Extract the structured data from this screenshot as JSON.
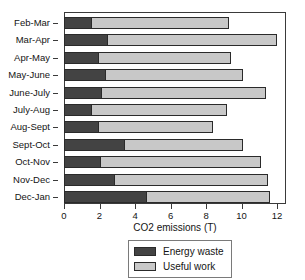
{
  "chart_data": {
    "type": "bar",
    "orientation": "horizontal",
    "stacked": true,
    "title": "",
    "xlabel": "CO2 emissions (T)",
    "ylabel": "",
    "xlim": [
      0,
      12.5
    ],
    "xticks": [
      0,
      2,
      4,
      6,
      8,
      10,
      12
    ],
    "xtick_labels": [
      "0",
      "2",
      "4",
      "6",
      "8",
      "10",
      "12"
    ],
    "grid": false,
    "legend_position": "bottom-center",
    "categories": [
      "Feb-Mar",
      "Mar-Apr",
      "Apr-May",
      "May-June",
      "June-July",
      "July-Aug",
      "Aug-Sept",
      "Sept-Oct",
      "Oct-Nov",
      "Nov-Dec",
      "Dec-Jan"
    ],
    "series": [
      {
        "name": "Energy waste",
        "color": "#434343",
        "values": [
          1.5,
          2.4,
          1.9,
          2.3,
          2.1,
          1.5,
          1.9,
          3.4,
          2.0,
          2.8,
          4.6
        ]
      },
      {
        "name": "Useful work",
        "color": "#c8c8c8",
        "values": [
          7.8,
          9.6,
          7.5,
          7.8,
          9.3,
          7.7,
          6.5,
          6.7,
          9.1,
          8.7,
          7.0
        ]
      }
    ],
    "totals": [
      9.3,
      12.0,
      9.4,
      10.1,
      11.4,
      9.2,
      8.4,
      10.1,
      11.1,
      11.5,
      11.6
    ]
  },
  "legend": {
    "entries": [
      {
        "label": "Energy waste",
        "color": "#434343"
      },
      {
        "label": "Useful work",
        "color": "#c8c8c8"
      }
    ]
  }
}
